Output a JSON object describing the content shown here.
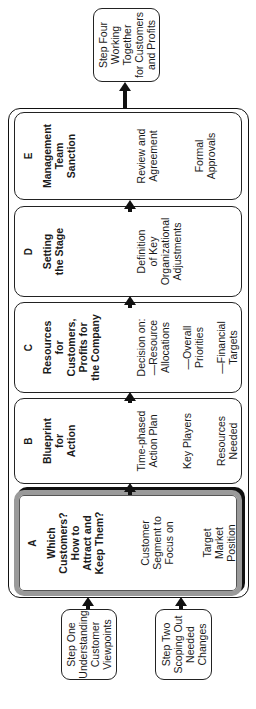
{
  "diagram": {
    "input_steps": [
      {
        "label": "Step One\nUnderstanding\nCustomer\nViewpoints"
      },
      {
        "label": "Step Two\nScoping Out\nNeeded\nChanges"
      }
    ],
    "output_step": {
      "label": "Step Four\nWorking\nTogether\nfor Customers\nand Profits"
    },
    "phases": [
      {
        "letter": "A",
        "title": "Which\nCustomers?\nHow to\nAttract and\nKeep Them?",
        "items": [
          "Customer\nSegment to\nFocus on",
          "Target\nMarket\nPosition"
        ],
        "highlighted": true
      },
      {
        "letter": "B",
        "title": "Blueprint\nfor\nAction",
        "items": [
          "Time-phased\nAction Plan",
          "Key Players",
          "Resources\nNeeded"
        ]
      },
      {
        "letter": "C",
        "title": "Resources\nfor\nCustomers,\nProfits for\nthe Company",
        "items": [
          "Decision on:\n—Resource\nAllocations",
          "—Overall\nPriorities",
          "—Financial\nTargets"
        ]
      },
      {
        "letter": "D",
        "title": "Setting\nthe Stage",
        "items": [
          "Definition\nof Key\nOrganizational\nAdjustments"
        ]
      },
      {
        "letter": "E",
        "title": "Management\nTeam\nSanction",
        "items": [
          "Review and\nAgreement",
          "Formal\nApprovals"
        ]
      }
    ],
    "colors": {
      "line": "#111111",
      "highlight_border": "#9a9a9a",
      "background": "#ffffff"
    }
  }
}
